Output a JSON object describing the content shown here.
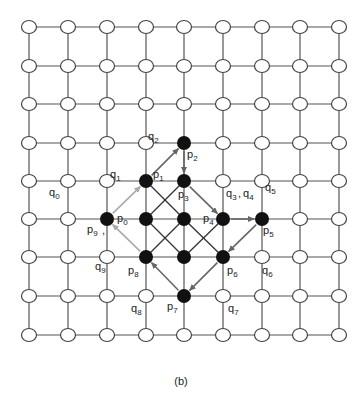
{
  "caption": "(b)",
  "grid": {
    "cols": 9,
    "rows": 9,
    "x": [
      29,
      68,
      107,
      146,
      184,
      223,
      262,
      300,
      339
    ],
    "y": [
      27,
      66,
      104,
      143,
      181,
      219,
      257,
      296,
      335
    ],
    "node_radius": 7,
    "line_color": "#555555",
    "node_fill": "#ffffff",
    "node_stroke": "#444444"
  },
  "black_nodes": [
    {
      "c": 4,
      "r": 3
    },
    {
      "c": 3,
      "r": 4
    },
    {
      "c": 4,
      "r": 4
    },
    {
      "c": 2,
      "r": 5
    },
    {
      "c": 3,
      "r": 5
    },
    {
      "c": 4,
      "r": 5
    },
    {
      "c": 5,
      "r": 5
    },
    {
      "c": 6,
      "r": 5
    },
    {
      "c": 3,
      "r": 6
    },
    {
      "c": 4,
      "r": 6
    },
    {
      "c": 5,
      "r": 6
    },
    {
      "c": 4,
      "r": 7
    }
  ],
  "black_node_color": "#111111",
  "diagonals": [
    {
      "from": [
        3,
        4
      ],
      "to": [
        4,
        5
      ]
    },
    {
      "from": [
        4,
        4
      ],
      "to": [
        3,
        5
      ]
    },
    {
      "from": [
        3,
        5
      ],
      "to": [
        4,
        6
      ]
    },
    {
      "from": [
        4,
        5
      ],
      "to": [
        3,
        6
      ]
    },
    {
      "from": [
        4,
        5
      ],
      "to": [
        5,
        6
      ]
    },
    {
      "from": [
        5,
        5
      ],
      "to": [
        4,
        6
      ]
    }
  ],
  "arrows": [
    {
      "name": "p9-to-p1",
      "from": [
        2,
        5
      ],
      "to": [
        3,
        4
      ],
      "color": "#aaaaaa"
    },
    {
      "name": "p1-to-p2",
      "from": [
        3,
        4
      ],
      "to": [
        4,
        3
      ],
      "color": "#666666"
    },
    {
      "name": "p2-to-p3",
      "from": [
        4,
        3
      ],
      "to": [
        4,
        4
      ],
      "color": "#666666"
    },
    {
      "name": "p3-to-p4",
      "from": [
        4,
        4
      ],
      "to": [
        5,
        5
      ],
      "color": "#666666"
    },
    {
      "name": "p4-to-p5",
      "from": [
        5,
        5
      ],
      "to": [
        6,
        5
      ],
      "color": "#666666"
    },
    {
      "name": "p5-to-p6",
      "from": [
        6,
        5
      ],
      "to": [
        5,
        6
      ],
      "color": "#666666"
    },
    {
      "name": "p6-to-p7",
      "from": [
        5,
        6
      ],
      "to": [
        4,
        7
      ],
      "color": "#666666"
    },
    {
      "name": "p7-to-p8",
      "from": [
        4,
        7
      ],
      "to": [
        3,
        6
      ],
      "color": "#666666"
    },
    {
      "name": "p8-to-p9",
      "from": [
        3,
        6
      ],
      "to": [
        2,
        5
      ],
      "color": "#aaaaaa"
    }
  ],
  "labels": [
    {
      "base": "q",
      "sub": "0",
      "x": 49,
      "y": 196
    },
    {
      "base": "q",
      "sub": "1",
      "x": 110,
      "y": 178
    },
    {
      "base": "q",
      "sub": "2",
      "x": 148,
      "y": 140
    },
    {
      "base": "p",
      "sub": "1",
      "x": 153,
      "y": 178
    },
    {
      "base": "p",
      "sub": "2",
      "x": 187,
      "y": 158
    },
    {
      "base": "p",
      "sub": "3",
      "x": 178,
      "y": 198
    },
    {
      "base": "q",
      "sub": "3",
      "x": 226,
      "y": 197
    },
    {
      "text": ",",
      "x": 238,
      "y": 197
    },
    {
      "base": "q",
      "sub": "4",
      "x": 243,
      "y": 197
    },
    {
      "base": "q",
      "sub": "5",
      "x": 265,
      "y": 191
    },
    {
      "base": "p",
      "sub": "0",
      "x": 117,
      "y": 222
    },
    {
      "base": "p",
      "sub": "9",
      "x": 87,
      "y": 233
    },
    {
      "text": ",",
      "x": 102,
      "y": 234
    },
    {
      "base": "p",
      "sub": "4",
      "x": 203,
      "y": 222
    },
    {
      "base": "p",
      "sub": "5",
      "x": 263,
      "y": 234
    },
    {
      "base": "q",
      "sub": "9",
      "x": 95,
      "y": 270
    },
    {
      "base": "p",
      "sub": "8",
      "x": 128,
      "y": 274
    },
    {
      "base": "p",
      "sub": "6",
      "x": 227,
      "y": 274
    },
    {
      "base": "q",
      "sub": "6",
      "x": 262,
      "y": 274
    },
    {
      "base": "q",
      "sub": "8",
      "x": 131,
      "y": 312
    },
    {
      "base": "p",
      "sub": "7",
      "x": 167,
      "y": 310
    },
    {
      "base": "q",
      "sub": "7",
      "x": 228,
      "y": 312
    }
  ]
}
